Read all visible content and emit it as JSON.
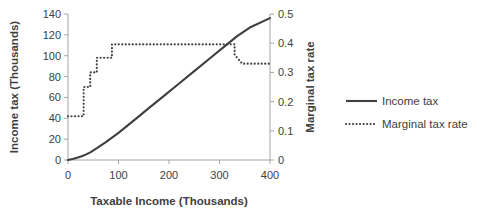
{
  "chart_data": {
    "type": "line",
    "title": "",
    "xlabel": "Taxable Income (Thousands)",
    "ylabel": "Income tax (Thousands)",
    "y2label": "Marginal tax rate",
    "xlim": [
      0,
      400
    ],
    "ylim": [
      0,
      140
    ],
    "y2lim": [
      0,
      0.5
    ],
    "xticks": [
      "0",
      "100",
      "200",
      "300",
      "400"
    ],
    "xtick_values": [
      0,
      100,
      200,
      300,
      400
    ],
    "yticks": [
      "0",
      "20",
      "40",
      "60",
      "80",
      "100",
      "120",
      "140"
    ],
    "ytick_values": [
      0,
      20,
      40,
      60,
      80,
      100,
      120,
      140
    ],
    "y2ticks": [
      "0",
      "0.1",
      "0.2",
      "0.3",
      "0.4",
      "0.5"
    ],
    "y2tick_values": [
      0,
      0.1,
      0.2,
      0.3,
      0.4,
      0.5
    ],
    "grid": false,
    "legend_position": "right",
    "series": [
      {
        "name": "Income tax",
        "axis": "left",
        "style": "solid",
        "color": "#3f3f3f",
        "x": [
          0,
          9,
          18,
          27,
          36,
          45,
          58,
          75,
          100,
          130,
          160,
          190,
          220,
          250,
          280,
          310,
          335,
          360,
          400
        ],
        "values": [
          0,
          1.0,
          2.2,
          3.6,
          5.4,
          7.6,
          11.6,
          17.2,
          26.0,
          37.8,
          49.7,
          61.5,
          73.4,
          85.2,
          97.1,
          108.9,
          118.8,
          127.0,
          136.0
        ]
      },
      {
        "name": "Marginal tax rate",
        "axis": "right",
        "style": "dotted",
        "color": "#3f3f3f",
        "x": [
          0,
          31,
          31,
          44,
          44,
          57,
          57,
          87,
          87,
          330,
          330,
          345,
          400
        ],
        "values": [
          0.15,
          0.15,
          0.25,
          0.25,
          0.3,
          0.3,
          0.35,
          0.35,
          0.396,
          0.396,
          0.36,
          0.33,
          0.33
        ]
      }
    ]
  },
  "legend": {
    "entries": [
      {
        "label": "Income tax",
        "style": "solid"
      },
      {
        "label": "Marginal tax rate",
        "style": "dotted"
      }
    ]
  }
}
